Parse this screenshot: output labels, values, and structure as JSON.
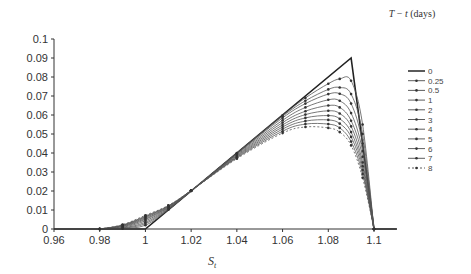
{
  "chart_data": {
    "type": "line",
    "title": "",
    "xlabel": "S_t",
    "xlabel_main": "S",
    "xlabel_sub": "t",
    "ylabel": "",
    "legend_title": "T − t (days)",
    "legend_title_T": "T",
    "legend_title_rest": " − ",
    "legend_title_t": "t",
    "legend_title_unit": " (days)",
    "legend_position": "right",
    "xlim": [
      0.96,
      1.11
    ],
    "ylim": [
      0,
      0.1
    ],
    "xticks": [
      0.96,
      0.98,
      1,
      1.02,
      1.04,
      1.06,
      1.08,
      1.1
    ],
    "xtick_labels": [
      "0.96",
      "0.98",
      "1",
      "1.02",
      "1.04",
      "1.06",
      "1.08",
      "1.1"
    ],
    "yticks": [
      0,
      0.01,
      0.02,
      0.03,
      0.04,
      0.05,
      0.06,
      0.07,
      0.08,
      0.09,
      0.1
    ],
    "ytick_labels": [
      "0",
      "0.01",
      "0.02",
      "0.03",
      "0.04",
      "0.05",
      "0.06",
      "0.07",
      "0.08",
      "0.09",
      "0.1"
    ],
    "grid": false,
    "series": [
      {
        "name": "0",
        "style": "solid-bold",
        "x": [
          0.96,
          1.0,
          1.09,
          1.1,
          1.11
        ],
        "y": [
          0,
          0,
          0.09,
          0,
          0
        ]
      },
      {
        "name": "0.25",
        "style": "marker",
        "x": [
          0.98,
          0.99,
          1.0,
          1.01,
          1.02,
          1.04,
          1.06,
          1.07,
          1.08,
          1.085,
          1.09,
          1.095,
          1.1
        ],
        "y": [
          0,
          0.0002,
          0.002,
          0.0101,
          0.02,
          0.04,
          0.0598,
          0.069,
          0.0765,
          0.079,
          0.078,
          0.055,
          0
        ]
      },
      {
        "name": "0.5",
        "style": "marker",
        "x": [
          0.98,
          0.99,
          1.0,
          1.01,
          1.02,
          1.04,
          1.06,
          1.07,
          1.08,
          1.085,
          1.09,
          1.095,
          1.1
        ],
        "y": [
          0,
          0.0004,
          0.0028,
          0.0103,
          0.02,
          0.0399,
          0.0593,
          0.0675,
          0.0735,
          0.0745,
          0.071,
          0.05,
          0
        ]
      },
      {
        "name": "1",
        "style": "marker",
        "x": [
          0.98,
          0.99,
          1.0,
          1.01,
          1.02,
          1.04,
          1.06,
          1.07,
          1.08,
          1.085,
          1.09,
          1.095,
          1.1
        ],
        "y": [
          0,
          0.0006,
          0.0035,
          0.0106,
          0.0201,
          0.0397,
          0.0585,
          0.066,
          0.071,
          0.0712,
          0.066,
          0.045,
          0
        ]
      },
      {
        "name": "2",
        "style": "marker",
        "x": [
          0.98,
          0.99,
          1.0,
          1.01,
          1.02,
          1.04,
          1.06,
          1.07,
          1.08,
          1.085,
          1.09,
          1.095,
          1.1
        ],
        "y": [
          0,
          0.0009,
          0.0043,
          0.0109,
          0.0201,
          0.0394,
          0.0572,
          0.064,
          0.068,
          0.0675,
          0.061,
          0.041,
          0
        ]
      },
      {
        "name": "3",
        "style": "marker",
        "x": [
          0.98,
          0.99,
          1.0,
          1.01,
          1.02,
          1.04,
          1.06,
          1.07,
          1.08,
          1.085,
          1.09,
          1.095,
          1.1
        ],
        "y": [
          0,
          0.0012,
          0.005,
          0.0112,
          0.0202,
          0.039,
          0.056,
          0.062,
          0.065,
          0.064,
          0.057,
          0.038,
          0
        ]
      },
      {
        "name": "4",
        "style": "marker",
        "x": [
          0.98,
          0.99,
          1.0,
          1.01,
          1.02,
          1.04,
          1.06,
          1.07,
          1.08,
          1.085,
          1.09,
          1.095,
          1.1
        ],
        "y": [
          0,
          0.0015,
          0.0055,
          0.0115,
          0.0202,
          0.0386,
          0.0548,
          0.0602,
          0.0622,
          0.0608,
          0.054,
          0.035,
          0
        ]
      },
      {
        "name": "5",
        "style": "marker",
        "x": [
          0.98,
          0.99,
          1.0,
          1.01,
          1.02,
          1.04,
          1.06,
          1.07,
          1.08,
          1.085,
          1.09,
          1.095,
          1.1
        ],
        "y": [
          0,
          0.0017,
          0.006,
          0.0118,
          0.0202,
          0.0382,
          0.0537,
          0.0585,
          0.0597,
          0.058,
          0.051,
          0.033,
          0
        ]
      },
      {
        "name": "6",
        "style": "marker",
        "x": [
          0.98,
          0.99,
          1.0,
          1.01,
          1.02,
          1.04,
          1.06,
          1.07,
          1.08,
          1.085,
          1.09,
          1.095,
          1.1
        ],
        "y": [
          0,
          0.0019,
          0.0064,
          0.012,
          0.0202,
          0.0378,
          0.0526,
          0.0568,
          0.0574,
          0.0555,
          0.0485,
          0.031,
          0
        ]
      },
      {
        "name": "7",
        "style": "marker",
        "x": [
          0.98,
          0.99,
          1.0,
          1.01,
          1.02,
          1.04,
          1.06,
          1.07,
          1.08,
          1.085,
          1.09,
          1.095,
          1.1
        ],
        "y": [
          0,
          0.0021,
          0.0068,
          0.0122,
          0.0202,
          0.0374,
          0.0515,
          0.0552,
          0.0552,
          0.0532,
          0.046,
          0.029,
          0
        ]
      },
      {
        "name": "8",
        "style": "dashed-marker",
        "x": [
          0.98,
          0.99,
          1.0,
          1.01,
          1.02,
          1.04,
          1.06,
          1.07,
          1.08,
          1.085,
          1.09,
          1.095,
          1.1
        ],
        "y": [
          0,
          0.0023,
          0.0072,
          0.0124,
          0.0202,
          0.037,
          0.0505,
          0.0537,
          0.0532,
          0.051,
          0.044,
          0.027,
          0
        ]
      }
    ]
  }
}
